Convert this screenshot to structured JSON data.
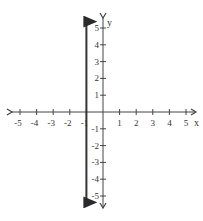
{
  "chart_data": {
    "type": "line",
    "title": "",
    "xlabel": "x",
    "ylabel": "y",
    "xlim": [
      -5,
      5
    ],
    "ylim": [
      -5,
      5
    ],
    "grid": false,
    "x_ticks": [
      -5,
      -4,
      -3,
      -2,
      -1,
      1,
      2,
      3,
      4,
      5
    ],
    "y_ticks": [
      5,
      4,
      3,
      2,
      1,
      -1,
      -2,
      -3,
      -4,
      -5
    ],
    "x_tick_labels": [
      "-5",
      "-4",
      "-3",
      "-2",
      "-1",
      "1",
      "2",
      "3",
      "4",
      "5"
    ],
    "y_tick_labels": [
      "5",
      "4",
      "3",
      "2",
      "1",
      "-1",
      "-2",
      "-3",
      "-4",
      "-5"
    ],
    "series": [
      {
        "name": "vertical line x = -1",
        "equation": "x = -1",
        "points": [
          [
            -1,
            5.5
          ],
          [
            -1,
            -5.5
          ]
        ],
        "arrows": "both",
        "color": "#333333"
      }
    ]
  },
  "axes": {
    "x_label": "x",
    "y_label": "y",
    "color": "#444444"
  }
}
